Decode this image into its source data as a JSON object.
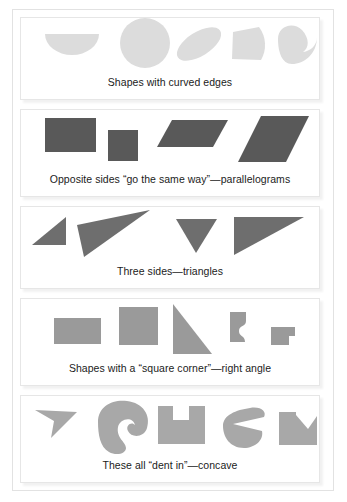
{
  "page": {
    "background_color": "#ffffff",
    "frame_border_color": "#e2e2e2",
    "panel_border_color": "#e6e6e6",
    "caption_color": "#1b1b1b"
  },
  "panels": [
    {
      "id": "curved-edges",
      "caption": "Shapes with curved edges",
      "shape_fill": "#dcdcdc",
      "shape_count": 5,
      "shapes": [
        {
          "name": "half-disc",
          "kind": "semicircle"
        },
        {
          "name": "circle",
          "kind": "circle"
        },
        {
          "name": "ellipse-tilted",
          "kind": "ellipse"
        },
        {
          "name": "circular-sector",
          "kind": "sector"
        },
        {
          "name": "crescent-bean",
          "kind": "bean"
        }
      ]
    },
    {
      "id": "parallelograms",
      "caption": "Opposite sides “go the same way”—parallelograms",
      "shape_fill": "#595959",
      "shape_count": 4,
      "shapes": [
        {
          "name": "rectangle",
          "kind": "rectangle"
        },
        {
          "name": "square",
          "kind": "square"
        },
        {
          "name": "flat-parallelogram",
          "kind": "parallelogram"
        },
        {
          "name": "slanted-parallelogram",
          "kind": "parallelogram"
        }
      ]
    },
    {
      "id": "triangles",
      "caption": "Three sides—triangles",
      "shape_fill": "#6e6e6e",
      "shape_count": 4,
      "shapes": [
        {
          "name": "small-right-triangle",
          "kind": "triangle"
        },
        {
          "name": "long-sliver-triangle",
          "kind": "triangle"
        },
        {
          "name": "downward-triangle",
          "kind": "triangle"
        },
        {
          "name": "wide-right-triangle",
          "kind": "triangle"
        }
      ]
    },
    {
      "id": "right-angle",
      "caption": "Shapes with a “square corner”—right angle",
      "shape_fill": "#9a9a9a",
      "shape_count": 5,
      "shapes": [
        {
          "name": "rectangle",
          "kind": "rectangle"
        },
        {
          "name": "square",
          "kind": "square"
        },
        {
          "name": "right-triangle",
          "kind": "triangle"
        },
        {
          "name": "curvy-flag-polygon",
          "kind": "irregular"
        },
        {
          "name": "l-shaped-polygon",
          "kind": "l-shape"
        }
      ]
    },
    {
      "id": "concave",
      "caption": "These all “dent in”—concave",
      "shape_fill": "#a8a8a8",
      "shape_count": 5,
      "shapes": [
        {
          "name": "arrow-dart",
          "kind": "dart"
        },
        {
          "name": "kidney-blob",
          "kind": "blob"
        },
        {
          "name": "notched-rectangle",
          "kind": "u-shape"
        },
        {
          "name": "pac-man-blob",
          "kind": "blob"
        },
        {
          "name": "zigzag-notch-rectangle",
          "kind": "notched"
        }
      ]
    }
  ]
}
